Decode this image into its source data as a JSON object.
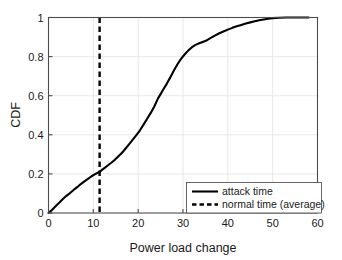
{
  "chart_data": {
    "type": "line",
    "title": "",
    "xlabel": "Power load change",
    "ylabel": "CDF",
    "xlim": [
      0,
      60
    ],
    "ylim": [
      0,
      1
    ],
    "grid": true,
    "legend_position": "lower right",
    "xticks": [
      "0",
      "10",
      "20",
      "30",
      "40",
      "50",
      "60"
    ],
    "xtick_values": [
      0,
      10,
      20,
      30,
      40,
      50,
      60
    ],
    "yticks": [
      "0",
      "0.2",
      "0.4",
      "0.6",
      "0.8",
      "1"
    ],
    "ytick_values": [
      0,
      0.2,
      0.4,
      0.6,
      0.8,
      1
    ],
    "series": [
      {
        "name": "attack time",
        "style": "solid",
        "color": "#000000",
        "x": [
          0,
          0.6,
          1.2,
          1.8,
          2.5,
          3.2,
          4.0,
          4.8,
          5.6,
          6.4,
          7.2,
          8.0,
          8.8,
          9.6,
          10.4,
          11.0,
          11.5,
          12.0,
          12.6,
          13.2,
          14.0,
          14.8,
          15.6,
          16.4,
          17.2,
          18.0,
          18.8,
          19.6,
          20.4,
          21.2,
          22.0,
          22.8,
          23.6,
          24.4,
          25.0,
          25.6,
          26.4,
          27.2,
          28.0,
          28.8,
          29.6,
          30.4,
          31.2,
          32.0,
          32.8,
          33.6,
          34.4,
          35.2,
          36.0,
          37.0,
          38.0,
          39.0,
          40.0,
          41.0,
          42.0,
          43.0,
          44.0,
          45.0,
          46.0,
          47.0,
          48.0,
          49.0,
          50.0,
          51.5,
          53.0,
          55.0,
          58.0
        ],
        "y": [
          0.0,
          0.012,
          0.026,
          0.04,
          0.055,
          0.072,
          0.088,
          0.102,
          0.118,
          0.132,
          0.148,
          0.162,
          0.175,
          0.188,
          0.199,
          0.206,
          0.212,
          0.222,
          0.232,
          0.243,
          0.257,
          0.272,
          0.29,
          0.308,
          0.33,
          0.352,
          0.375,
          0.398,
          0.423,
          0.452,
          0.482,
          0.512,
          0.545,
          0.585,
          0.608,
          0.632,
          0.662,
          0.695,
          0.73,
          0.762,
          0.79,
          0.812,
          0.832,
          0.848,
          0.86,
          0.868,
          0.875,
          0.882,
          0.893,
          0.906,
          0.918,
          0.928,
          0.938,
          0.947,
          0.955,
          0.962,
          0.969,
          0.975,
          0.981,
          0.986,
          0.99,
          0.994,
          0.997,
          0.999,
          1.0,
          1.0,
          1.0
        ]
      },
      {
        "name": "normal time (average)",
        "style": "dashed",
        "color": "#000000",
        "type": "vline",
        "x_value": 11.4
      }
    ],
    "legend_entries": [
      {
        "label": "attack time",
        "style": "solid"
      },
      {
        "label": "normal time (average)",
        "style": "dashed"
      }
    ]
  }
}
